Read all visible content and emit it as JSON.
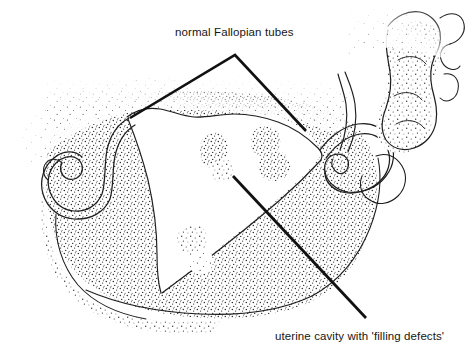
{
  "figure": {
    "type": "line-art-medical-illustration",
    "width": 472,
    "height": 355,
    "background_color": "#ffffff",
    "ink_color": "#1a1a1a",
    "stipple_color": "#2b2b2b"
  },
  "annotations": {
    "top": {
      "text": "normal Fallopian tubes",
      "x": 175,
      "y": 26,
      "leader": {
        "type": "chevron",
        "apex": [
          235,
          55
        ],
        "left_end": [
          130,
          118
        ],
        "right_end": [
          306,
          131
        ]
      }
    },
    "bottom": {
      "text": "uterine cavity with 'filling defects'",
      "x": 275,
      "y": 330,
      "leader": {
        "type": "line",
        "start": [
          233,
          176
        ],
        "end": [
          366,
          318
        ]
      }
    }
  },
  "structures": {
    "uterine_cavity": {
      "name": "uterine cavity",
      "fill": "white",
      "description": "central triangular lucent cavity"
    },
    "filling_defects": {
      "name": "filling defects",
      "count": 5,
      "description": "small stippled blobs inside the lucent uterine cavity"
    },
    "left_fallopian_tube": {
      "name": "left Fallopian tube",
      "description": "serpentine double-outlined tube extending to the left"
    },
    "right_fallopian_tube": {
      "name": "right Fallopian tube",
      "description": "coiled double-outlined tube extending to the right"
    },
    "contrast_spill": {
      "name": "contrast spill",
      "description": "lobulated stippled region in the upper right"
    },
    "contrast_mass": {
      "name": "contrast mass",
      "description": "large stippled contrast pool filling the pelvis"
    }
  }
}
